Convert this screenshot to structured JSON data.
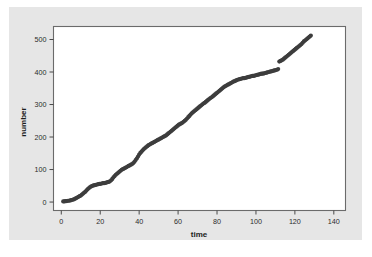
{
  "figure": {
    "background_color": "#ffffff",
    "panel_color": "#e6e6e6",
    "plot_area_color": "#ffffff",
    "frame_color": "#6b6b6b"
  },
  "chart_data": {
    "type": "scatter",
    "title": "",
    "subtitle": "",
    "xlabel": "time",
    "ylabel": "number",
    "xlim": [
      -4,
      146
    ],
    "ylim": [
      -26,
      540
    ],
    "xticks": [
      0,
      20,
      40,
      60,
      80,
      100,
      120,
      140
    ],
    "yticks": [
      0,
      100,
      200,
      300,
      400,
      500
    ],
    "xtick_labels": [
      "0",
      "20",
      "40",
      "60",
      "80",
      "100",
      "120",
      "140"
    ],
    "ytick_labels": [
      "0",
      "100",
      "200",
      "300",
      "400",
      "500"
    ],
    "grid": false,
    "legend": null,
    "legend_position": "none",
    "marker": "filled-circle",
    "marker_color": "#3d3d3d",
    "marker_size": 2.1,
    "annotations": [],
    "series": [
      {
        "name": "cumulative count",
        "x": [
          1.0,
          1.6,
          2.2,
          2.8,
          3.4,
          4.0,
          4.6,
          5.2,
          5.8,
          6.4,
          7.0,
          7.6,
          8.2,
          8.8,
          9.4,
          10.0,
          10.6,
          11.2,
          11.8,
          12.4,
          13.0,
          13.6,
          14.2,
          14.8,
          15.4,
          16.0,
          16.6,
          17.2,
          17.8,
          18.4,
          19.0,
          19.6,
          20.2,
          20.8,
          21.4,
          22.0,
          22.6,
          23.2,
          23.8,
          24.4,
          25.0,
          25.6,
          26.2,
          26.8,
          27.4,
          28.0,
          28.6,
          29.2,
          29.8,
          30.4,
          31.0,
          31.6,
          32.2,
          32.8,
          33.4,
          34.0,
          34.6,
          35.2,
          35.8,
          36.4,
          37.0,
          37.6,
          38.2,
          38.8,
          39.4,
          40.0,
          40.6,
          41.2,
          41.8,
          42.4,
          43.0,
          43.6,
          44.2,
          44.8,
          45.4,
          46.0,
          46.6,
          47.2,
          47.8,
          48.4,
          49.0,
          49.6,
          50.2,
          50.8,
          51.4,
          52.0,
          52.6,
          53.2,
          53.8,
          54.4,
          55.0,
          55.6,
          56.2,
          56.8,
          57.4,
          58.0,
          58.6,
          59.2,
          59.8,
          60.4,
          61.0,
          61.6,
          62.2,
          62.8,
          63.4,
          64.0,
          64.6,
          65.2,
          65.8,
          66.4,
          67.0,
          67.6,
          68.2,
          68.8,
          69.4,
          70.0,
          70.6,
          71.2,
          71.8,
          72.4,
          73.0,
          73.6,
          74.2,
          74.8,
          75.4,
          76.0,
          76.6,
          77.2,
          77.8,
          78.4,
          79.0,
          79.6,
          80.2,
          80.8,
          81.4,
          82.0,
          82.6,
          83.2,
          83.8,
          84.4,
          85.0,
          85.6,
          86.2,
          86.8,
          87.4,
          88.0,
          88.6,
          89.2,
          89.8,
          90.4,
          91.0,
          91.6,
          92.2,
          92.8,
          93.4,
          94.0,
          94.6,
          95.2,
          95.8,
          96.4,
          97.0,
          97.6,
          98.2,
          98.8,
          99.4,
          100.0,
          100.6,
          101.2,
          101.8,
          102.4,
          103.0,
          103.6,
          104.2,
          104.8,
          105.4,
          106.0,
          106.6,
          107.2,
          107.8,
          108.4,
          109.0,
          109.6,
          110.2,
          110.8,
          111.4,
          112.0,
          112.6,
          113.2,
          113.8,
          114.4,
          115.0,
          115.6,
          116.2,
          116.8,
          117.4,
          118.0,
          118.6,
          119.2,
          119.8,
          120.4,
          121.0,
          121.6,
          122.2,
          122.8,
          123.4,
          124.0,
          124.6,
          125.2,
          125.8,
          126.4,
          127.0,
          127.6,
          128.2
        ],
        "y": [
          2,
          2,
          3,
          3,
          4,
          4,
          5,
          6,
          7,
          8,
          10,
          12,
          14,
          16,
          18,
          20,
          23,
          26,
          29,
          32,
          36,
          40,
          43,
          46,
          48,
          50,
          51,
          52,
          53,
          54,
          55,
          56,
          56,
          57,
          58,
          58,
          59,
          60,
          61,
          62,
          64,
          67,
          71,
          76,
          80,
          84,
          87,
          90,
          93,
          96,
          99,
          101,
          103,
          105,
          107,
          109,
          111,
          113,
          115,
          117,
          120,
          124,
          129,
          134,
          140,
          146,
          151,
          155,
          159,
          163,
          166,
          169,
          172,
          175,
          177,
          179,
          181,
          183,
          185,
          187,
          189,
          191,
          193,
          195,
          197,
          199,
          201,
          203,
          205,
          208,
          211,
          214,
          217,
          220,
          223,
          226,
          229,
          232,
          235,
          238,
          240,
          242,
          244,
          247,
          250,
          253,
          257,
          261,
          265,
          269,
          273,
          276,
          279,
          282,
          285,
          288,
          291,
          294,
          297,
          300,
          303,
          305,
          308,
          311,
          314,
          317,
          320,
          322,
          325,
          328,
          331,
          334,
          337,
          340,
          343,
          346,
          349,
          352,
          355,
          357,
          359,
          361,
          363,
          365,
          367,
          369,
          371,
          372,
          374,
          376,
          377,
          378,
          379,
          380,
          381,
          381,
          382,
          383,
          384,
          385,
          386,
          387,
          388,
          388,
          389,
          390,
          391,
          392,
          393,
          394,
          395,
          395,
          396,
          397,
          398,
          399,
          400,
          401,
          402,
          403,
          404,
          405,
          406,
          407,
          409,
          432,
          434,
          436,
          438,
          441,
          444,
          447,
          450,
          453,
          456,
          459,
          462,
          465,
          468,
          471,
          474,
          477,
          480,
          483,
          486,
          490,
          494,
          497,
          500,
          503,
          506,
          509,
          512
        ]
      }
    ]
  }
}
